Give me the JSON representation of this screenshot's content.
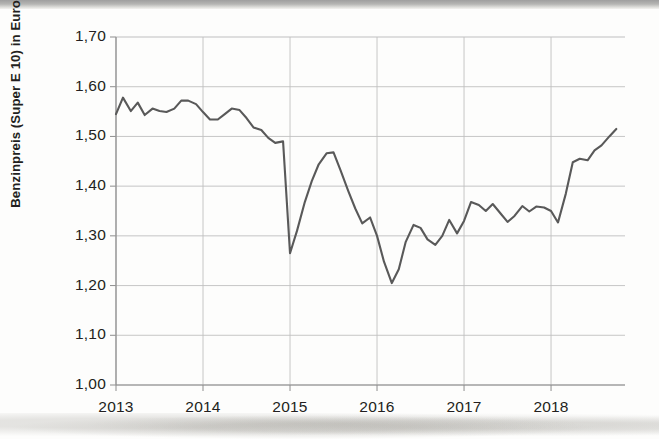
{
  "figure": {
    "y_axis_title": "Benzinpreis (Super E 10) in Euro/Liter",
    "line_color": "#595959",
    "grid_color": "#bfbfbf",
    "text_color": "#231f20",
    "background": "#fdfdfc"
  },
  "chart_data": {
    "type": "line",
    "title": "",
    "subtitle": "",
    "xlabel": "",
    "ylabel": "Benzinpreis (Super E 10) in Euro/Liter",
    "ylim": [
      1.0,
      1.7
    ],
    "ytick_labels": [
      "1,70",
      "1,60",
      "1,50",
      "1,40",
      "1,30",
      "1,20",
      "1,10",
      "1,00"
    ],
    "ytick_values": [
      1.7,
      1.6,
      1.5,
      1.4,
      1.3,
      1.2,
      1.1,
      1.0
    ],
    "xtick_labels": [
      "2013",
      "2014",
      "2015",
      "2016",
      "2017",
      "2018"
    ],
    "xtick_values": [
      2013,
      2014,
      2015,
      2016,
      2017,
      2018
    ],
    "xlim": [
      2013.0,
      2018.85
    ],
    "grid": true,
    "legend": false,
    "legend_position": "none",
    "x_unit": "year (monthly samples)",
    "series": [
      {
        "name": "Benzinpreis Super E 10",
        "color": "#595959",
        "x": [
          2013.0,
          2013.08,
          2013.17,
          2013.25,
          2013.33,
          2013.42,
          2013.5,
          2013.58,
          2013.67,
          2013.75,
          2013.83,
          2013.92,
          2014.0,
          2014.08,
          2014.17,
          2014.25,
          2014.33,
          2014.42,
          2014.5,
          2014.58,
          2014.67,
          2014.75,
          2014.83,
          2014.92,
          2015.0,
          2015.08,
          2015.17,
          2015.25,
          2015.33,
          2015.42,
          2015.5,
          2015.58,
          2015.67,
          2015.75,
          2015.83,
          2015.92,
          2016.0,
          2016.08,
          2016.17,
          2016.25,
          2016.33,
          2016.42,
          2016.5,
          2016.58,
          2016.67,
          2016.75,
          2016.83,
          2016.92,
          2017.0,
          2017.08,
          2017.17,
          2017.25,
          2017.33,
          2017.42,
          2017.5,
          2017.58,
          2017.67,
          2017.75,
          2017.83,
          2017.92,
          2018.0,
          2018.08,
          2018.17,
          2018.25,
          2018.33,
          2018.42,
          2018.5,
          2018.58,
          2018.67,
          2018.75
        ],
        "values": [
          1.545,
          1.578,
          1.551,
          1.568,
          1.543,
          1.556,
          1.551,
          1.549,
          1.556,
          1.572,
          1.572,
          1.565,
          1.549,
          1.534,
          1.534,
          1.545,
          1.556,
          1.553,
          1.537,
          1.518,
          1.513,
          1.497,
          1.487,
          1.49,
          1.265,
          1.31,
          1.368,
          1.41,
          1.444,
          1.466,
          1.468,
          1.432,
          1.39,
          1.355,
          1.325,
          1.337,
          1.3,
          1.248,
          1.205,
          1.233,
          1.288,
          1.322,
          1.316,
          1.293,
          1.282,
          1.3,
          1.332,
          1.305,
          1.33,
          1.368,
          1.362,
          1.35,
          1.364,
          1.345,
          1.328,
          1.34,
          1.36,
          1.349,
          1.359,
          1.357,
          1.35,
          1.327,
          1.385,
          1.448,
          1.455,
          1.452,
          1.472,
          1.482,
          1.5,
          1.515
        ]
      }
    ]
  }
}
